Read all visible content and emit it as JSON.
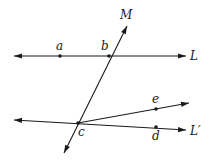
{
  "diagram": {
    "type": "geometry",
    "colors": {
      "stroke": "#1a1a1a",
      "background": "#ffffff"
    },
    "lines": [
      {
        "name": "L",
        "label": "L",
        "kind": "line",
        "from": [
          14,
          56
        ],
        "to": [
          186,
          56
        ],
        "label_pos": [
          190,
          60
        ]
      },
      {
        "name": "M",
        "label": "M",
        "kind": "line",
        "from": [
          64,
          153
        ],
        "to": [
          127,
          26
        ],
        "label_pos": [
          120,
          19
        ]
      },
      {
        "name": "L-prime",
        "label": "L′",
        "kind": "line",
        "from": [
          14,
          120
        ],
        "to": [
          186,
          130
        ],
        "label_pos": [
          190,
          135
        ]
      },
      {
        "name": "ray-ce",
        "label": "",
        "kind": "ray",
        "from": [
          78,
          123
        ],
        "to": [
          189,
          103
        ],
        "label_pos": null
      }
    ],
    "points": [
      {
        "name": "a",
        "label": "a",
        "pos": [
          60,
          56
        ],
        "label_pos": [
          56,
          50
        ]
      },
      {
        "name": "b",
        "label": "b",
        "pos": [
          109,
          56
        ],
        "label_pos": [
          101,
          50
        ]
      },
      {
        "name": "c",
        "label": "c",
        "pos": [
          78,
          123
        ],
        "label_pos": [
          78,
          136
        ]
      },
      {
        "name": "d",
        "label": "d",
        "pos": [
          156,
          127
        ],
        "label_pos": [
          152,
          140
        ]
      },
      {
        "name": "e",
        "label": "e",
        "pos": [
          156,
          109
        ],
        "label_pos": [
          152,
          103
        ]
      }
    ]
  }
}
